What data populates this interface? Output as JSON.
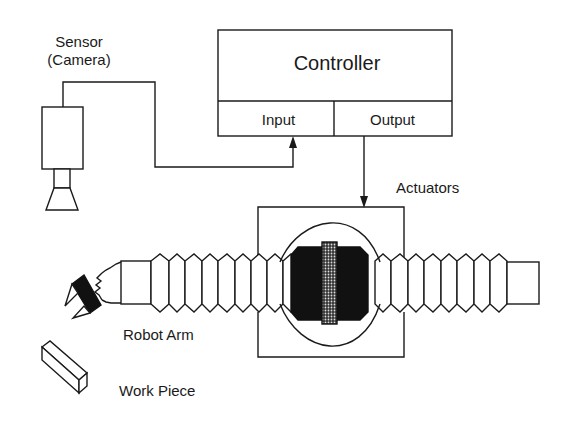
{
  "diagram": {
    "type": "block-diagram",
    "labels": {
      "sensor": "Sensor",
      "sensor_sub": "(Camera)",
      "controller": "Controller",
      "input": "Input",
      "output": "Output",
      "actuators": "Actuators",
      "robot_arm": "Robot Arm",
      "work_piece": "Work Piece"
    },
    "connections": [
      {
        "from": "sensor",
        "to": "controller.input",
        "arrow": "end"
      },
      {
        "from": "controller.output",
        "to": "actuators",
        "arrow": "end"
      }
    ],
    "colors": {
      "line": "#1a1a1a",
      "fill_dark": "#111111",
      "background": "#ffffff"
    }
  }
}
